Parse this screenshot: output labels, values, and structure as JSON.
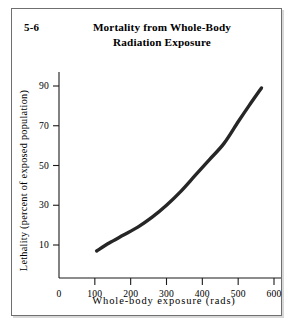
{
  "figure": {
    "number": "5-6",
    "title_line1": "Mortality from Whole-Body",
    "title_line2": "Radiation Exposure"
  },
  "colors": {
    "curve": "#262626",
    "axis": "#1a1a1a",
    "frame": "#6f6f6f",
    "background": "#ffffff"
  },
  "chart_data": {
    "type": "line",
    "title": "Mortality from Whole-Body Radiation Exposure",
    "xlabel": "Whole-body exposure (rads)",
    "ylabel": "Lethality (percent of exposed population)",
    "xlim": [
      0,
      640
    ],
    "ylim": [
      0,
      100
    ],
    "grid": false,
    "legend": null,
    "xticks": [
      0,
      100,
      200,
      300,
      400,
      500,
      600
    ],
    "xtick_labels": [
      "0",
      "100",
      "200",
      "300",
      "400",
      "500",
      "600"
    ],
    "yticks": [
      10,
      30,
      50,
      70,
      90
    ],
    "ytick_labels": [
      "10",
      "30",
      "50",
      "70",
      "90"
    ],
    "series": [
      {
        "name": "Lethality vs whole-body exposure",
        "x": [
          105,
          140,
          180,
          220,
          260,
          300,
          340,
          380,
          420,
          460,
          500,
          530,
          565
        ],
        "y": [
          7,
          11,
          15,
          19,
          24,
          30,
          37,
          45,
          53,
          61,
          72,
          80,
          89
        ]
      }
    ]
  }
}
